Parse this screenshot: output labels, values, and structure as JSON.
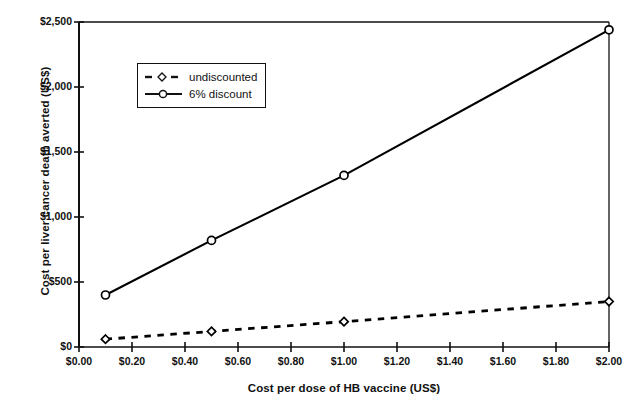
{
  "chart_data": {
    "type": "line",
    "title": "",
    "xlabel": "Cost per dose of HB vaccine (US$)",
    "ylabel": "Cost per liver cancer death averted (US$)",
    "xlim": [
      0.0,
      2.0
    ],
    "ylim": [
      0,
      2500
    ],
    "xticks": [
      0.0,
      0.2,
      0.4,
      0.6,
      0.8,
      1.0,
      1.2,
      1.4,
      1.6,
      1.8,
      2.0
    ],
    "xtick_labels": [
      "$0.00",
      "$0.20",
      "$0.40",
      "$0.60",
      "$0.80",
      "$1.00",
      "$1.20",
      "$1.40",
      "$1.60",
      "$1.80",
      "$2.00"
    ],
    "yticks": [
      0,
      500,
      1000,
      1500,
      2000,
      2500
    ],
    "ytick_labels": [
      "$0",
      "$500",
      "$1,000",
      "$1,500",
      "$2,000",
      "$2,500"
    ],
    "grid": false,
    "legend_position": "upper-left-inside",
    "series": [
      {
        "name": "undiscounted",
        "marker": "diamond",
        "linestyle": "dashed",
        "color": "#000000",
        "x": [
          0.1,
          0.5,
          1.0,
          2.0
        ],
        "values": [
          60,
          120,
          195,
          350
        ]
      },
      {
        "name": "6% discount",
        "marker": "circle",
        "linestyle": "solid",
        "color": "#000000",
        "x": [
          0.1,
          0.5,
          1.0,
          2.0
        ],
        "values": [
          400,
          820,
          1320,
          2440
        ]
      }
    ]
  },
  "legend": {
    "items": [
      {
        "label": "undiscounted",
        "marker": "diamond-marker-icon",
        "style": "dashed"
      },
      {
        "label": "6% discount",
        "marker": "circle-marker-icon",
        "style": "solid"
      }
    ]
  },
  "colors": {
    "ink": "#111111",
    "plot_line": "#000000",
    "background": "#ffffff"
  }
}
